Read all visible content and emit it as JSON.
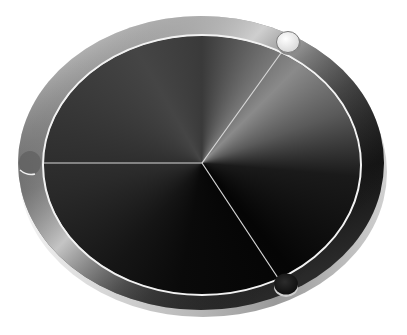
{
  "scene": {
    "subject": "3D rendered dial disc",
    "segments": 3,
    "colors": {
      "background": "#ffffff",
      "rim_light": "#d8d8d8",
      "rim_dark": "#3a3a3a",
      "face_dark": "#0a0a0a",
      "face_light": "#6a6a6a",
      "ring_line": "#f2f2f2",
      "knob_light": "#eeeeee",
      "knob_dark": "#1a1a1a"
    },
    "knobs": [
      {
        "name": "top-right",
        "style": "light"
      },
      {
        "name": "bottom-right",
        "style": "dark"
      },
      {
        "name": "left",
        "style": "hidden"
      }
    ]
  }
}
